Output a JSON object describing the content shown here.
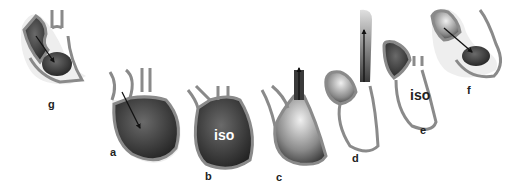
{
  "diagram": {
    "panels": [
      {
        "id": "g",
        "label": "g",
        "phase_text": ""
      },
      {
        "id": "a",
        "label": "a",
        "phase_text": ""
      },
      {
        "id": "b",
        "label": "b",
        "phase_text": "iso"
      },
      {
        "id": "c",
        "label": "c",
        "phase_text": ""
      },
      {
        "id": "d",
        "label": "d",
        "phase_text": ""
      },
      {
        "id": "e",
        "label": "e",
        "phase_text": "iso"
      },
      {
        "id": "f",
        "label": "f",
        "phase_text": ""
      }
    ],
    "colors": {
      "wall": "#8a8a8a",
      "wall_dark": "#5a5a5a",
      "halo": "#e8e8e8",
      "chamber_dark": "#2a2a2a",
      "chamber_light": "#d8d8d8",
      "iso_text_dark_bg": "#ffffff",
      "iso_text_light_bg": "#222222",
      "arrow": "#111111"
    }
  }
}
